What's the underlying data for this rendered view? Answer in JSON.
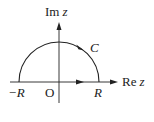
{
  "diagram": {
    "axes": {
      "x_label_prefix": "Re",
      "x_label_var": "z",
      "y_label_prefix": "Im",
      "y_label_var": "z"
    },
    "origin_label": "O",
    "points": {
      "neg_R": "−R",
      "R": "R"
    },
    "contour_label": "C",
    "colors": {
      "stroke": "#222222",
      "background": "#ffffff"
    }
  }
}
